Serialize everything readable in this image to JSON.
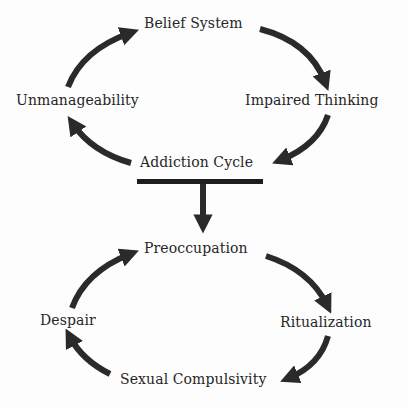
{
  "diagram": {
    "top_cycle": {
      "nodes": [
        {
          "id": "belief",
          "label": "Belief System"
        },
        {
          "id": "impaired",
          "label": "Impaired Thinking"
        },
        {
          "id": "addiction",
          "label": "Addiction Cycle"
        },
        {
          "id": "unmanage",
          "label": "Unmanageability"
        }
      ],
      "edges": [
        {
          "from": "belief",
          "to": "impaired"
        },
        {
          "from": "impaired",
          "to": "addiction"
        },
        {
          "from": "addiction",
          "to": "unmanage"
        },
        {
          "from": "unmanage",
          "to": "belief"
        }
      ]
    },
    "connector": {
      "from": "addiction",
      "to": "preoccupation",
      "style": "T-bar with down arrow"
    },
    "bottom_cycle": {
      "nodes": [
        {
          "id": "preoccupation",
          "label": "Preoccupation"
        },
        {
          "id": "ritualization",
          "label": "Ritualization"
        },
        {
          "id": "compulsivity",
          "label": "Sexual Compulsivity"
        },
        {
          "id": "despair",
          "label": "Despair"
        }
      ],
      "edges": [
        {
          "from": "preoccupation",
          "to": "ritualization"
        },
        {
          "from": "ritualization",
          "to": "compulsivity"
        },
        {
          "from": "compulsivity",
          "to": "despair"
        },
        {
          "from": "despair",
          "to": "preoccupation"
        }
      ]
    },
    "colors": {
      "arrow": "#2a2a2a",
      "text": "#262626",
      "background": "#fdfdfd"
    }
  }
}
